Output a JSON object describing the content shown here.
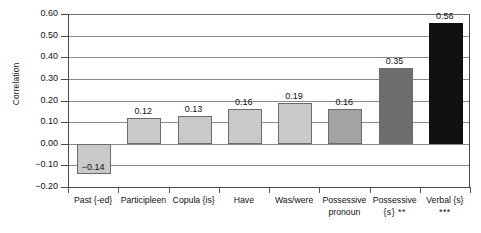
{
  "chart_data": {
    "type": "bar",
    "title": "",
    "xlabel": "",
    "ylabel": "Correlation",
    "ylim": [
      -0.2,
      0.6
    ],
    "ytick_step": 0.1,
    "grid": true,
    "legend": "none",
    "categories": [
      "Past {-ed}",
      "Participleen",
      "Copula {is}",
      "Have",
      "Was/were",
      "Possessive\npronoun",
      "Possessive\n{s}",
      "Verbal {s}"
    ],
    "significance": [
      "",
      "",
      "",
      "",
      "",
      "",
      "**",
      "***"
    ],
    "values": [
      -0.14,
      0.12,
      0.13,
      0.16,
      0.19,
      0.16,
      0.35,
      0.56
    ],
    "value_labels": [
      "-0.14",
      "0.12",
      "0.13",
      "0.16",
      "0.19",
      "0.16",
      "0.35",
      "0.56"
    ],
    "bar_shades": [
      "light",
      "light",
      "light",
      "light",
      "light",
      "mid",
      "dark",
      "black"
    ],
    "ytick_labels": [
      "0.60",
      "0.50",
      "0.40",
      "0.30",
      "0.20",
      "0.10",
      "0.00",
      "-0.10",
      "-0.20"
    ],
    "ytick_values": [
      0.6,
      0.5,
      0.4,
      0.3,
      0.2,
      0.1,
      0.0,
      -0.1,
      -0.2
    ],
    "colors": {
      "light": "#c9c9c9",
      "mid": "#a3a3a3",
      "dark": "#6e6e6e",
      "black": "#111111",
      "grid": "#8c8c8c",
      "axis": "#4a4a4a",
      "background": "#ffffff",
      "text": "#111111"
    }
  }
}
